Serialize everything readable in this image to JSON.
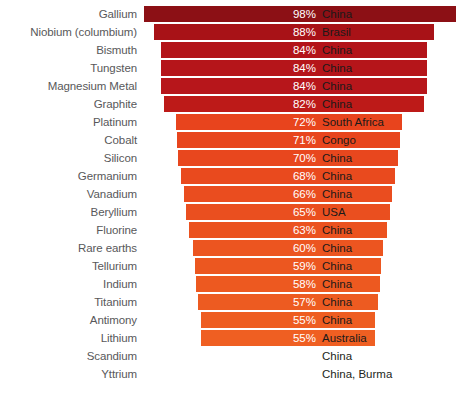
{
  "chart_data": {
    "type": "bar",
    "title": "",
    "subtitle": "",
    "xlabel": "",
    "ylabel": "",
    "grid": false,
    "legend": "none",
    "orientation": "horizontal",
    "style": "centered-funnel",
    "xlim": [
      0,
      100
    ],
    "value_suffix": "%",
    "categories": [
      "Gallium",
      "Niobium (columbium)",
      "Bismuth",
      "Tungsten",
      "Magnesium Metal",
      "Graphite",
      "Platinum",
      "Cobalt",
      "Silicon",
      "Germanium",
      "Vanadium",
      "Beryllium",
      "Fluorine",
      "Rare earths",
      "Tellurium",
      "Indium",
      "Titanium",
      "Antimony",
      "Lithium",
      "Scandium",
      "Yttrium"
    ],
    "values": [
      98,
      88,
      84,
      84,
      84,
      82,
      72,
      71,
      70,
      68,
      66,
      65,
      63,
      60,
      59,
      58,
      57,
      55,
      55,
      null,
      null
    ],
    "value_labels": [
      "98%",
      "88%",
      "84%",
      "84%",
      "84%",
      "82%",
      "72%",
      "71%",
      "70%",
      "68%",
      "66%",
      "65%",
      "63%",
      "60%",
      "59%",
      "58%",
      "57%",
      "55%",
      "55%",
      "",
      ""
    ],
    "annotations": [
      "China",
      "Brasil",
      "China",
      "China",
      "China",
      "China",
      "South Africa",
      "Congo",
      "China",
      "China",
      "China",
      "USA",
      "China",
      "China",
      "China",
      "China",
      "China",
      "China",
      "Australia",
      "China",
      "China, Burma"
    ],
    "bar_colors": [
      "#8c1015",
      "#a81217",
      "#b31419",
      "#b5151a",
      "#b7161b",
      "#bd1a18",
      "#e8441d",
      "#e8451d",
      "#e8471e",
      "#e94a1e",
      "#ea4d1f",
      "#ea4f1f",
      "#eb521f",
      "#ec5520",
      "#ec5720",
      "#ed5920",
      "#ed5b21",
      "#ee5d21",
      "#ef5f22",
      null,
      null
    ]
  },
  "rows": [
    {
      "label": "Gallium",
      "pct": "98%",
      "country": "China",
      "value": 98,
      "color": "#8c1015",
      "bar_left": 144,
      "bar_width": 312,
      "has_bar": true
    },
    {
      "label": "Niobium (columbium)",
      "pct": "88%",
      "country": "Brasil",
      "value": 88,
      "color": "#a81217",
      "bar_left": 154,
      "bar_width": 280,
      "has_bar": true
    },
    {
      "label": "Bismuth",
      "pct": "84%",
      "country": "China",
      "value": 84,
      "color": "#b31419",
      "bar_left": 161,
      "bar_width": 266,
      "has_bar": true
    },
    {
      "label": "Tungsten",
      "pct": "84%",
      "country": "China",
      "value": 84,
      "color": "#b5151a",
      "bar_left": 161,
      "bar_width": 266,
      "has_bar": true
    },
    {
      "label": "Magnesium Metal",
      "pct": "84%",
      "country": "China",
      "value": 84,
      "color": "#b7161b",
      "bar_left": 161,
      "bar_width": 266,
      "has_bar": true
    },
    {
      "label": "Graphite",
      "pct": "82%",
      "country": "China",
      "value": 82,
      "color": "#bd1a18",
      "bar_left": 164,
      "bar_width": 260,
      "has_bar": true
    },
    {
      "label": "Platinum",
      "pct": "72%",
      "country": "South Africa",
      "value": 72,
      "color": "#e8441d",
      "bar_left": 176,
      "bar_width": 226,
      "has_bar": true
    },
    {
      "label": "Cobalt",
      "pct": "71%",
      "country": "Congo",
      "value": 71,
      "color": "#e8451d",
      "bar_left": 177,
      "bar_width": 223,
      "has_bar": true
    },
    {
      "label": "Silicon",
      "pct": "70%",
      "country": "China",
      "value": 70,
      "color": "#e8471e",
      "bar_left": 178,
      "bar_width": 220,
      "has_bar": true
    },
    {
      "label": "Germanium",
      "pct": "68%",
      "country": "China",
      "value": 68,
      "color": "#e94a1e",
      "bar_left": 181,
      "bar_width": 214,
      "has_bar": true
    },
    {
      "label": "Vanadium",
      "pct": "66%",
      "country": "China",
      "value": 66,
      "color": "#ea4d1f",
      "bar_left": 184,
      "bar_width": 208,
      "has_bar": true
    },
    {
      "label": "Beryllium",
      "pct": "65%",
      "country": "USA",
      "value": 65,
      "color": "#ea4f1f",
      "bar_left": 186,
      "bar_width": 204,
      "has_bar": true
    },
    {
      "label": "Fluorine",
      "pct": "63%",
      "country": "China",
      "value": 63,
      "color": "#eb521f",
      "bar_left": 189,
      "bar_width": 198,
      "has_bar": true
    },
    {
      "label": "Rare earths",
      "pct": "60%",
      "country": "China",
      "value": 60,
      "color": "#ec5520",
      "bar_left": 193,
      "bar_width": 190,
      "has_bar": true
    },
    {
      "label": "Tellurium",
      "pct": "59%",
      "country": "China",
      "value": 59,
      "color": "#ec5720",
      "bar_left": 195,
      "bar_width": 186,
      "has_bar": true
    },
    {
      "label": "Indium",
      "pct": "58%",
      "country": "China",
      "value": 58,
      "color": "#ed5920",
      "bar_left": 196,
      "bar_width": 184,
      "has_bar": true
    },
    {
      "label": "Titanium",
      "pct": "57%",
      "country": "China",
      "value": 57,
      "color": "#ed5b21",
      "bar_left": 198,
      "bar_width": 180,
      "has_bar": true
    },
    {
      "label": "Antimony",
      "pct": "55%",
      "country": "China",
      "value": 55,
      "color": "#ee5d21",
      "bar_left": 201,
      "bar_width": 174,
      "has_bar": true
    },
    {
      "label": "Lithium",
      "pct": "55%",
      "country": "Australia",
      "value": 55,
      "color": "#ef5f22",
      "bar_left": 201,
      "bar_width": 174,
      "has_bar": true
    },
    {
      "label": "Scandium",
      "pct": "",
      "country": "China",
      "value": null,
      "color": null,
      "bar_left": 0,
      "bar_width": 0,
      "has_bar": false
    },
    {
      "label": "Yttrium",
      "pct": "",
      "country": "China, Burma",
      "value": null,
      "color": null,
      "bar_left": 0,
      "bar_width": 0,
      "has_bar": false
    }
  ],
  "layout": {
    "row_height": 18,
    "top_offset": 5,
    "label_color": "#58585a",
    "pct_color": "#ffffff",
    "country_color": "#1a1a1a",
    "background": "#ffffff"
  }
}
